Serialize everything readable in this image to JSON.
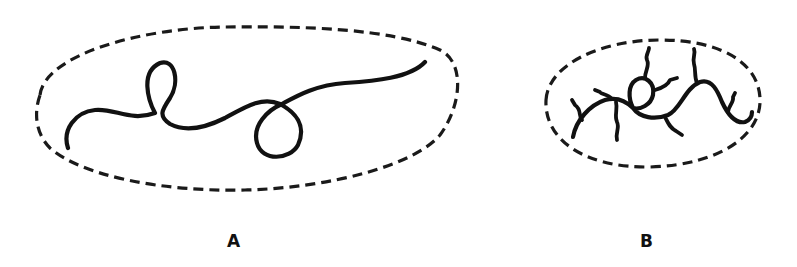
{
  "figure": {
    "panels": [
      {
        "id": "A",
        "label": "A",
        "content": "linear-chain",
        "envelope": "dashed-ellipse-large",
        "loops": 2
      },
      {
        "id": "B",
        "label": "B",
        "content": "branched-chain",
        "envelope": "dashed-ellipse-small",
        "loops": 1
      }
    ],
    "colors": {
      "background": "#ffffff",
      "ink": "#111111"
    }
  }
}
